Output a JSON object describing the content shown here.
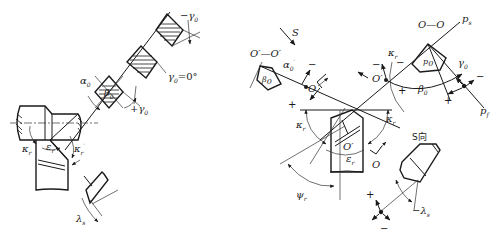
{
  "diagram": {
    "type": "engineering-drawing",
    "left_figure": {
      "labels": {
        "neg_gamma0": "−γ",
        "neg_gamma0_sub": "0",
        "gamma0_zero": "γ",
        "gamma0_zero_sub": "0",
        "gamma0_zero_eq": "=0°",
        "alpha0": "α",
        "alpha0_sub": "0",
        "beta0": "β",
        "beta0_sub": "0",
        "pos_gamma0": "+γ",
        "pos_gamma0_sub": "0",
        "kappa_r": "κ",
        "kappa_r_sub": "r",
        "epsilon_r": "ε",
        "epsilon_r_sub": "r",
        "kappa_r_prime": "κ",
        "kappa_r_prime_sub": "r",
        "kappa_prime_mark": "′",
        "lambda_s": "λ",
        "lambda_s_sub": "s"
      }
    },
    "right_figure": {
      "labels": {
        "S": "S",
        "O_prime_O_prime": "O′—O′",
        "O_O": "O—O",
        "p_s": "p",
        "p_s_sub": "s",
        "p_f": "p",
        "p_f_sub": "f",
        "alpha0_prime": "α",
        "alpha0_prime_sub": "0",
        "alpha0_prime_mark": "′",
        "beta0_prime": "β",
        "beta0_prime_sub": "0",
        "O": "O",
        "O_prime": "O′",
        "kappa_r": "κ",
        "kappa_r_sub": "r",
        "gamma0": "γ",
        "gamma0_sub": "0",
        "beta0": "β",
        "beta0_sub": "0",
        "p0": "p",
        "p0_sub": "0",
        "kappa_r_left": "κ",
        "kappa_r_left_sub": "r",
        "kappa_r_prime": "κ",
        "kappa_r_prime_sub": "r",
        "epsilon_r": "ε",
        "epsilon_r_sub": "r",
        "psi_r": "ψ",
        "psi_r_sub": "r",
        "O_bottom": "O",
        "O_prime_center": "O′",
        "S_view": "S向",
        "neg_lambda_s": "−λ",
        "neg_lambda_s_sub": "s"
      },
      "signs": {
        "plus": "+",
        "minus": "−"
      }
    }
  }
}
